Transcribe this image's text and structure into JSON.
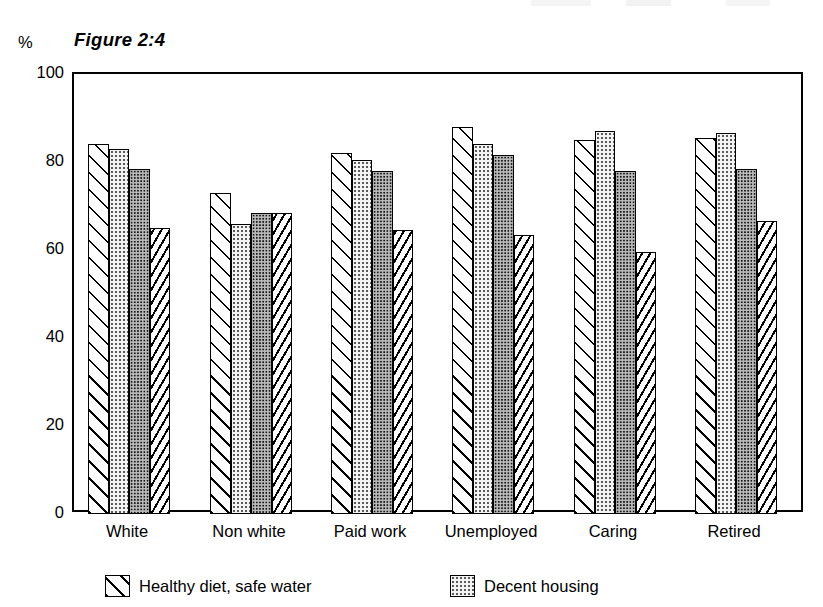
{
  "chart_data": {
    "type": "bar",
    "title": "Figure 2:4",
    "xlabel": "",
    "ylabel": "%",
    "ylim": [
      0,
      100
    ],
    "yticks": [
      0,
      20,
      40,
      60,
      80,
      100
    ],
    "ytick_labels": [
      "0",
      "20",
      "40",
      "60",
      "80",
      "100"
    ],
    "grid": false,
    "legend_position": "bottom",
    "categories": [
      "White",
      "Non white",
      "Paid work",
      "Unemployed",
      "Caring",
      "Retired"
    ],
    "series": [
      {
        "name": "Healthy diet, safe water",
        "pattern": "diagonal-hatch",
        "values": [
          84,
          73,
          82,
          88,
          85,
          85.5
        ]
      },
      {
        "name": "Decent housing",
        "pattern": "light-dots",
        "values": [
          83,
          66,
          80.5,
          84,
          87,
          86.5
        ]
      },
      {
        "name": "Series 3",
        "pattern": "dense-dark-dots",
        "values": [
          78.5,
          68.5,
          78,
          81.5,
          78,
          78.5
        ]
      },
      {
        "name": "Series 4",
        "pattern": "dashed-diagonal",
        "values": [
          65,
          68.5,
          64.5,
          63.5,
          59.5,
          66.5
        ]
      }
    ]
  },
  "title": "Figure 2:4",
  "axis": {
    "unit_label": "%",
    "y_tick_labels": [
      "100",
      "80",
      "60",
      "40",
      "20",
      "0"
    ]
  },
  "x_labels": [
    "White",
    "Non white",
    "Paid work",
    "Unemployed",
    "Caring",
    "Retired"
  ],
  "legend": {
    "items": [
      {
        "label": "Healthy diet, safe water",
        "pattern": "diagonal-hatch"
      },
      {
        "label": "Decent housing",
        "pattern": "light-dots"
      }
    ]
  },
  "colors": {
    "ink": "#000000",
    "paper": "#ffffff",
    "light_fill": "#f3f3f3",
    "dark_fill": "#b8b8b8"
  }
}
